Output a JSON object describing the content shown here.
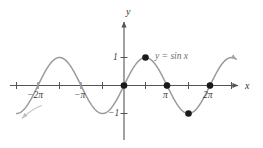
{
  "figure": {
    "background_color": "#ffffff",
    "curve_color": "#9a9a9a",
    "axis_color": "#555555",
    "point_color": "#1a1a1a"
  },
  "axes": {
    "x_axis_label": "x",
    "y_axis_label": "y",
    "x_tick_labels": [
      "−2π",
      "−π",
      "π",
      "2π"
    ],
    "y_tick_labels": [
      "1",
      "−1"
    ]
  },
  "annotations": {
    "curve_equation": "y = sin x"
  },
  "chart_data": {
    "type": "line",
    "title": "",
    "xlabel": "x",
    "ylabel": "y",
    "xlim": [
      -7.85,
      8.2
    ],
    "ylim": [
      -1.6,
      1.6
    ],
    "grid": false,
    "legend": "none",
    "xticks": [
      -6.283185,
      -3.141593,
      3.141593,
      6.283185
    ],
    "xticklabels": [
      "−2π",
      "−π",
      "π",
      "2π"
    ],
    "xtick_minor": [
      -7.853982,
      -4.712389,
      -1.570796,
      1.570796,
      4.712389,
      7.853982
    ],
    "yticks": [
      1,
      -1
    ],
    "yticklabels": [
      "1",
      "−1"
    ],
    "series": [
      {
        "name": "y = sin x",
        "expression": "sin(x)",
        "color": "#9a9a9a",
        "x_start": -7.85,
        "x_end": 8.2,
        "amplitude": 1,
        "period": 6.283185
      }
    ],
    "marked_points": [
      {
        "x": 0,
        "y": 0,
        "label": "0"
      },
      {
        "x": 1.570796,
        "y": 1,
        "label": "π/2"
      },
      {
        "x": 3.141593,
        "y": 0,
        "label": "π"
      },
      {
        "x": 4.712389,
        "y": -1,
        "label": "3π/2"
      },
      {
        "x": 6.283185,
        "y": 0,
        "label": "2π"
      }
    ],
    "annotations": [
      {
        "text": "y = sin x",
        "x": 2.2,
        "y": 1.18
      }
    ]
  }
}
